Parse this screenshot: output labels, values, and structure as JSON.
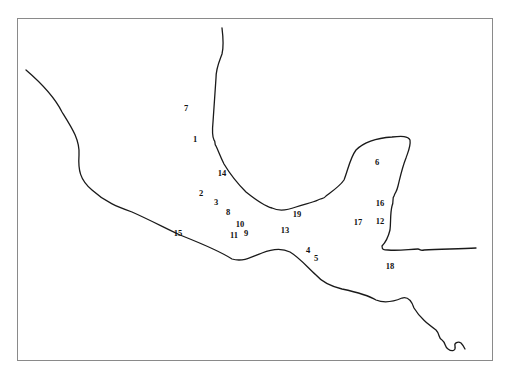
{
  "map": {
    "frame": {
      "border_color": "#8a8a8a",
      "background": "#ffffff"
    },
    "coastline_color": "#1a1a1a",
    "stations": [
      {
        "label": "1",
        "x": 195,
        "y": 139
      },
      {
        "label": "2",
        "x": 201,
        "y": 193
      },
      {
        "label": "3",
        "x": 216,
        "y": 202
      },
      {
        "label": "4",
        "x": 308,
        "y": 250
      },
      {
        "label": "5",
        "x": 316,
        "y": 258
      },
      {
        "label": "6",
        "x": 377,
        "y": 162
      },
      {
        "label": "7",
        "x": 186,
        "y": 108
      },
      {
        "label": "8",
        "x": 228,
        "y": 212
      },
      {
        "label": "9",
        "x": 246,
        "y": 233
      },
      {
        "label": "10",
        "x": 240,
        "y": 224
      },
      {
        "label": "11",
        "x": 234,
        "y": 235
      },
      {
        "label": "12",
        "x": 380,
        "y": 221
      },
      {
        "label": "13",
        "x": 285,
        "y": 230
      },
      {
        "label": "14",
        "x": 222,
        "y": 173
      },
      {
        "label": "15",
        "x": 178,
        "y": 233
      },
      {
        "label": "16",
        "x": 380,
        "y": 203
      },
      {
        "label": "17",
        "x": 358,
        "y": 222
      },
      {
        "label": "18",
        "x": 390,
        "y": 266
      },
      {
        "label": "19",
        "x": 297,
        "y": 214
      }
    ]
  }
}
